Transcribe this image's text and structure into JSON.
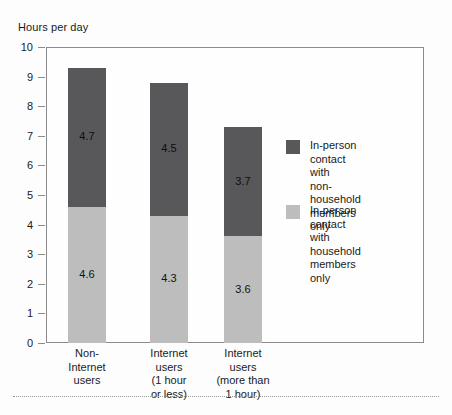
{
  "chart_data": {
    "type": "bar",
    "subtype": "stacked-vertical",
    "title": "",
    "ylabel": "Hours per day",
    "xlabel": "",
    "ylim": [
      0,
      10
    ],
    "ytick_step": 1,
    "yticks": [
      "10",
      "9",
      "8",
      "7",
      "6",
      "5",
      "4",
      "3",
      "2",
      "1",
      "0"
    ],
    "grid": false,
    "legend_position": "inside-right",
    "categories": [
      "Non-\nInternet\nusers",
      "Internet\nusers\n(1 hour\nor less)",
      "Internet\nusers\n(more than\n1 hour)"
    ],
    "series": [
      {
        "name": "In-person\ncontact with\nhousehold\nmembers only",
        "color": "#bdbdbd",
        "values": [
          4.6,
          4.3,
          3.6
        ],
        "labels": [
          "4.6",
          "4.3",
          "3.6"
        ]
      },
      {
        "name": "In-person\ncontact with\nnon-household\nmembers only",
        "color": "#58585a",
        "values": [
          4.7,
          4.5,
          3.7
        ],
        "labels": [
          "4.7",
          "4.5",
          "3.7"
        ]
      }
    ],
    "totals": [
      9.3,
      8.8,
      7.3
    ]
  },
  "legend": {
    "items": [
      {
        "swatch_color": "#58585a",
        "label": "In-person\ncontact with\nnon-household\nmembers only"
      },
      {
        "swatch_color": "#bdbdbd",
        "label": "In-person\ncontact with\nhousehold\nmembers only"
      }
    ]
  },
  "colors": {
    "axis": "#8b8b8b",
    "text": "#1a1a1a",
    "background": "#fdfdfd",
    "rule": "#9a9a9a",
    "series_dark": "#58585a",
    "series_light": "#bdbdbd"
  }
}
